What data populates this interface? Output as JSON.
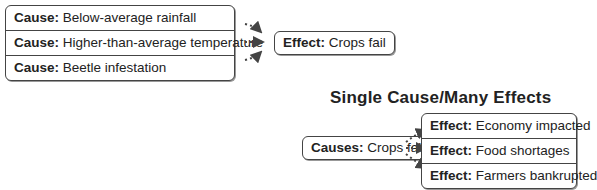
{
  "many_causes": {
    "causes": [
      {
        "label": "Cause:",
        "text": " Below-average rainfall"
      },
      {
        "label": "Cause:",
        "text": " Higher-than-average temperature"
      },
      {
        "label": "Cause:",
        "text": " Beetle infestation"
      }
    ],
    "effect": {
      "label": "Effect:",
      "text": " Crops fail"
    }
  },
  "many_effects": {
    "title": "Single Cause/Many Effects",
    "cause": {
      "label": "Causes:",
      "text": " Crops fail"
    },
    "effects": [
      {
        "label": "Effect:",
        "text": " Economy impacted"
      },
      {
        "label": "Effect:",
        "text": " Food shortages"
      },
      {
        "label": "Effect:",
        "text": " Farmers bankrupted"
      }
    ]
  },
  "colors": {
    "border": "#444444",
    "arrow": "#444444",
    "background": "#ffffff"
  }
}
